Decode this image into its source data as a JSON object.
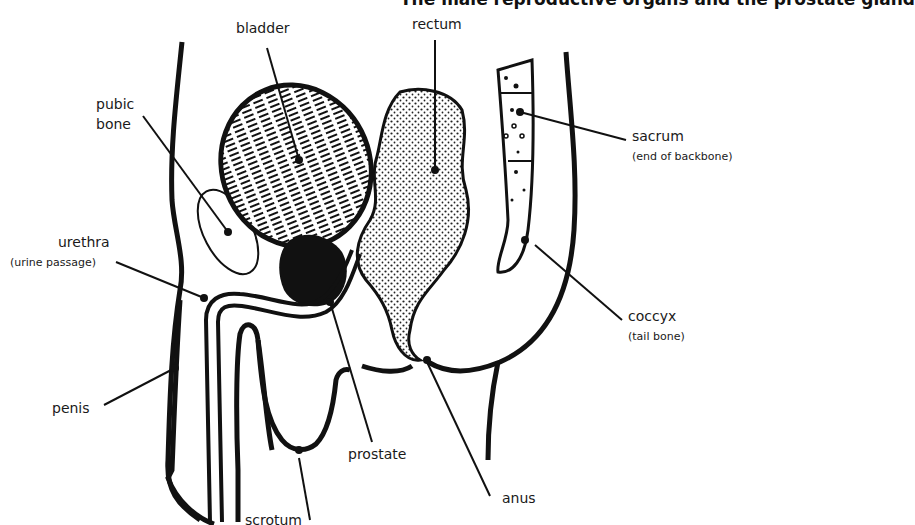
{
  "title": "The male reproductive organs and the prostate gland",
  "labels": {
    "bladder": "bladder",
    "rectum": "rectum",
    "pubic_bone_1": "pubic",
    "pubic_bone_2": "bone",
    "sacrum": "sacrum",
    "sacrum_sub": "(end of backbone)",
    "urethra": "urethra",
    "urethra_sub": "(urine passage)",
    "coccyx": "coccyx",
    "coccyx_sub": "(tail bone)",
    "penis": "penis",
    "prostate": "prostate",
    "anus": "anus",
    "scrotum": "scrotum"
  }
}
